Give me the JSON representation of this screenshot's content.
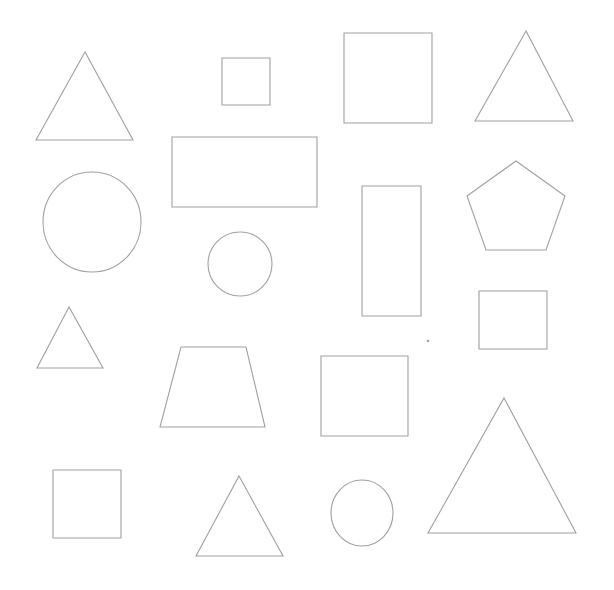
{
  "canvas": {
    "width": 614,
    "height": 590,
    "background_color": "#ffffff",
    "stroke_color": "#a0a0a0",
    "fill": "none",
    "stroke_width": 1.1,
    "title": "Outline Shapes Grid"
  },
  "summary": {
    "total_shapes": 18,
    "triangle_count": 5,
    "square_count": 6,
    "rectangle_count": 2,
    "circle_count": 3,
    "pentagon_count": 1,
    "trapezoid_count": 1
  },
  "shapes": [
    {
      "id": "triangle-large-top-left",
      "type": "triangle",
      "label": "Triangle",
      "points": "85,52 36,140 133,140",
      "bbox": [
        36,
        52,
        97,
        88
      ]
    },
    {
      "id": "square-small-top",
      "type": "square",
      "label": "Square",
      "x": 222,
      "y": 58,
      "width": 48,
      "height": 47
    },
    {
      "id": "square-large-top-center",
      "type": "square",
      "label": "Square",
      "x": 344,
      "y": 33,
      "width": 88,
      "height": 90
    },
    {
      "id": "triangle-top-right",
      "type": "triangle",
      "label": "Triangle",
      "points": "526,31 475,121 573,121",
      "bbox": [
        475,
        31,
        98,
        90
      ]
    },
    {
      "id": "rectangle-wide",
      "type": "rectangle",
      "label": "Rectangle",
      "x": 172,
      "y": 137,
      "width": 145,
      "height": 70
    },
    {
      "id": "pentagon-right",
      "type": "pentagon",
      "label": "Pentagon",
      "points": "516,161 565,196 546,250 486,250 467,196",
      "bbox": [
        467,
        161,
        98,
        89
      ]
    },
    {
      "id": "circle-large-left",
      "type": "circle",
      "label": "Circle",
      "cx": 92,
      "cy": 222,
      "rx": 49,
      "ry": 50
    },
    {
      "id": "rectangle-tall",
      "type": "rectangle",
      "label": "Rectangle",
      "x": 362,
      "y": 186,
      "width": 59,
      "height": 130
    },
    {
      "id": "circle-medium-center",
      "type": "circle",
      "label": "Circle",
      "cx": 240,
      "cy": 264,
      "rx": 32,
      "ry": 32
    },
    {
      "id": "square-right-middle",
      "type": "square",
      "label": "Square",
      "x": 479,
      "y": 291,
      "width": 68,
      "height": 58
    },
    {
      "id": "triangle-small-left",
      "type": "triangle",
      "label": "Triangle",
      "points": "69,307 37,368 103,368",
      "bbox": [
        37,
        307,
        66,
        61
      ]
    },
    {
      "id": "trapezoid-center",
      "type": "trapezoid",
      "label": "Trapezoid",
      "points": "181,347 246,347 265,427 160,427",
      "bbox": [
        160,
        347,
        105,
        80
      ]
    },
    {
      "id": "square-center-bottom",
      "type": "square",
      "label": "Square",
      "x": 321,
      "y": 356,
      "width": 87,
      "height": 80
    },
    {
      "id": "triangle-large-bottom-right",
      "type": "triangle",
      "label": "Triangle",
      "points": "504,398 576,533 428,533",
      "bbox": [
        428,
        398,
        148,
        135
      ]
    },
    {
      "id": "square-bottom-left",
      "type": "square",
      "label": "Square",
      "x": 53,
      "y": 470,
      "width": 68,
      "height": 68
    },
    {
      "id": "triangle-bottom-center",
      "type": "triangle",
      "label": "Triangle",
      "points": "239,476 283,556 196,556",
      "bbox": [
        196,
        476,
        87,
        80
      ]
    },
    {
      "id": "circle-small-bottom",
      "type": "circle",
      "label": "Circle",
      "cx": 362,
      "cy": 513,
      "rx": 31,
      "ry": 33
    },
    {
      "id": "dot-speck",
      "type": "dot",
      "label": "Speck",
      "cx": 428,
      "cy": 341,
      "rx": 0.8,
      "ry": 0.8
    }
  ]
}
